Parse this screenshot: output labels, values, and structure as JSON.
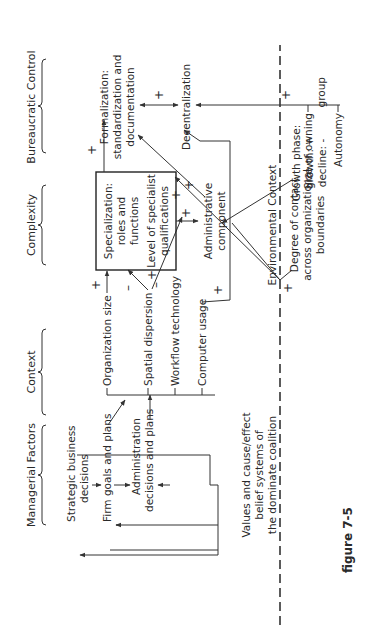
{
  "figure": {
    "caption": "figure 7-5"
  },
  "headers": {
    "managerial": "Managerial Factors",
    "context": "Context",
    "complexity": "Complexity",
    "bureaucratic": "Bureaucratic Control"
  },
  "managerial": {
    "strategic_l1": "Strategic business",
    "strategic_l2": "decisions",
    "firm_goals": "Firm goals and plans",
    "admin_l1": "Administration",
    "admin_l2": "decisions and plans",
    "values_l1": "Values and cause/effect",
    "values_l2": "belief systems of",
    "values_l3": "the dominate coalition"
  },
  "context": {
    "org_size": "Organization size",
    "spatial": "Spatial dispersion",
    "workflow": "Workflow technology",
    "computer": "Computer usage"
  },
  "complexity": {
    "spec_l1": "Specialization:",
    "spec_l2": "roles and",
    "spec_l3": "functions",
    "level_l1": "Level of specialist",
    "level_l2": "qualifications",
    "admin_comp_l1": "Administrative",
    "admin_comp_l2": "component"
  },
  "bureaucratic": {
    "form_l1": "Formalization:",
    "form_l2": "standardization and",
    "form_l3": "documentation",
    "decentralization": "Decentralization"
  },
  "environment": {
    "label": "Environmental Context",
    "degree_l1": "Degree of contact",
    "degree_l2": "across organizational",
    "degree_l3": "boundaries",
    "growth_l1": "Growth phase:",
    "growth_l2": "growth: +",
    "growth_l3": "decline: -",
    "size_owning_l1": "Size of owning",
    "size_owning_l2": "group",
    "autonomy": "Autonomy"
  },
  "signs": {
    "plus": "+",
    "minus": "–"
  }
}
